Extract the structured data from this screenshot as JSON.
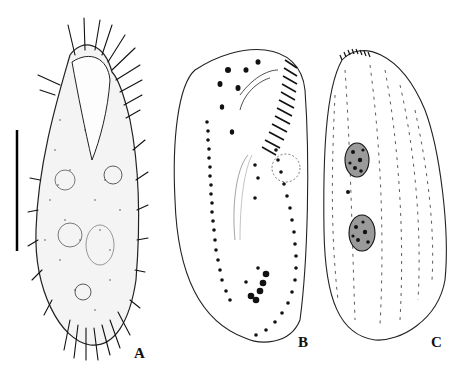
{
  "figure": {
    "panels": [
      {
        "id": "A",
        "label": "A",
        "description": "Ciliate specimen in vivo, ventral view, with cirri and scale bar"
      },
      {
        "id": "B",
        "label": "B",
        "description": "Ciliate ventral infraciliature with adoral zone of membranelles and cirral rows"
      },
      {
        "id": "C",
        "label": "C",
        "description": "Ciliate dorsal view with dorsal kineties and two macronuclear nodules"
      }
    ],
    "scale_bar": {
      "orientation": "vertical"
    },
    "colors": {
      "ink": "#111111",
      "background": "#ffffff",
      "stipple": "#555555"
    }
  }
}
